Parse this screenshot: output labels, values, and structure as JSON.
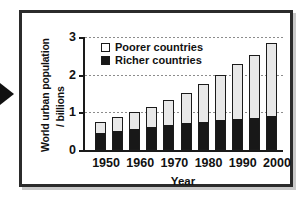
{
  "figure": {
    "pointer_icon": "left-pointer-triangle"
  },
  "chart_data": {
    "type": "bar",
    "subtype": "stacked-bar",
    "title": "",
    "xlabel": "Year",
    "ylabel": "World urban population / billions",
    "ylabel_line1": "World urban population",
    "ylabel_line2": "/ billions",
    "ylim": [
      0,
      3
    ],
    "yticks": [
      0,
      1,
      2,
      3
    ],
    "ytick_labels": [
      "0",
      "1",
      "2",
      "3"
    ],
    "grid": true,
    "legend_position": "upper-left-inside",
    "categories": [
      1950,
      1955,
      1960,
      1965,
      1970,
      1975,
      1980,
      1985,
      1990,
      1995,
      2000
    ],
    "xtick_labels": [
      "1950",
      "1960",
      "1970",
      "1980",
      "1990",
      "2000"
    ],
    "xtick_values": [
      1950,
      1960,
      1970,
      1980,
      1990,
      2000
    ],
    "series": [
      {
        "name": "Richer countries",
        "color": "#181818",
        "legend_icon": "filled-square",
        "values": [
          0.45,
          0.5,
          0.55,
          0.6,
          0.66,
          0.72,
          0.75,
          0.79,
          0.81,
          0.86,
          0.89
        ]
      },
      {
        "name": "Poorer countries",
        "color": "#e8e8e8",
        "legend_icon": "open-square",
        "values": [
          0.3,
          0.37,
          0.46,
          0.55,
          0.68,
          0.8,
          1.0,
          1.21,
          1.47,
          1.67,
          1.94
        ]
      }
    ],
    "totals": [
      0.75,
      0.87,
      1.01,
      1.15,
      1.34,
      1.52,
      1.75,
      2.0,
      2.28,
      2.53,
      2.83
    ]
  },
  "legend": {
    "items": [
      {
        "label": "Poorer countries",
        "swatch": "open-square"
      },
      {
        "label": "Richer countries",
        "swatch": "filled-square"
      }
    ]
  }
}
